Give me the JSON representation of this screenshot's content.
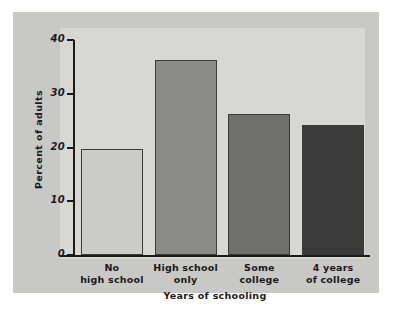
{
  "chart_data": {
    "type": "bar",
    "title": "",
    "xlabel": "Years of schooling",
    "ylabel": "Percent of adults",
    "categories": [
      "No high school",
      "High school only",
      "Some college",
      "4 years of college"
    ],
    "category_lines": [
      [
        "No",
        "high school"
      ],
      [
        "High school",
        "only"
      ],
      [
        "Some",
        "college"
      ],
      [
        "4 years",
        "of college"
      ]
    ],
    "values": [
      19.7,
      36.3,
      26.2,
      24.2
    ],
    "ylim": [
      0,
      40
    ],
    "yticks": [
      0,
      10,
      20,
      30,
      40
    ],
    "ytick_labels": [
      "0",
      "10",
      "20",
      "30",
      "40"
    ],
    "grid": false,
    "legend": "none",
    "bar_colors": [
      "#cbcbc8",
      "#8a8a87",
      "#6f6f6c",
      "#3b3b3b"
    ],
    "bar_edge_color": "#3a3a3a",
    "figure_background": "#c8c8c6",
    "plot_background": "#d7d7d4",
    "axis_color": "#1a1a1a"
  }
}
